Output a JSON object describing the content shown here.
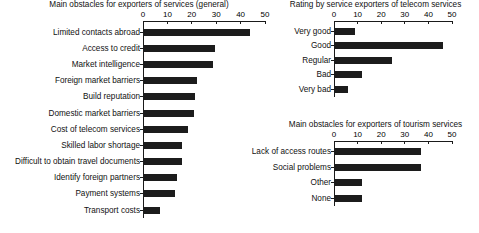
{
  "chart_data": [
    {
      "id": "general",
      "type": "bar",
      "orientation": "horizontal",
      "title": "Main obstacles for exporters of services (general)",
      "xlabel": "",
      "ylabel": "",
      "xlim": [
        0,
        50
      ],
      "ticks": [
        0,
        10,
        20,
        30,
        40,
        50
      ],
      "tick_labels": [
        "0",
        "10",
        "20",
        "30",
        "40",
        "50"
      ],
      "grid": false,
      "legend": "none",
      "categories": [
        "Limited contacts abroad",
        "Access to credit",
        "Market intelligence",
        "Foreign market barriers",
        "Build reputation",
        "Domestic market barriers",
        "Cost of telecom services",
        "Skilled labor shortage",
        "Difficult to obtain travel documents",
        "Identify foreign partners",
        "Payment systems",
        "Transport costs"
      ],
      "values": [
        44,
        29.5,
        28.5,
        22,
        21.5,
        21,
        18.5,
        16,
        16,
        14,
        13,
        7
      ]
    },
    {
      "id": "telecom",
      "type": "bar",
      "orientation": "horizontal",
      "title": "Rating by service exporters of telecom services",
      "xlabel": "",
      "ylabel": "",
      "xlim": [
        0,
        50
      ],
      "ticks": [
        0,
        10,
        20,
        30,
        40,
        50
      ],
      "tick_labels": [
        "0",
        "10",
        "20",
        "30",
        "40",
        "50"
      ],
      "grid": false,
      "legend": "none",
      "categories": [
        "Very good",
        "Good",
        "Regular",
        "Bad",
        "Very bad"
      ],
      "values": [
        9,
        46,
        24.5,
        12,
        6
      ]
    },
    {
      "id": "tourism",
      "type": "bar",
      "orientation": "horizontal",
      "title": "Main obstacles for exporters of tourism services",
      "xlabel": "",
      "ylabel": "",
      "xlim": [
        0,
        50
      ],
      "ticks": [
        0,
        10,
        20,
        30,
        40,
        50
      ],
      "tick_labels": [
        "0",
        "10",
        "20",
        "30",
        "40",
        "50"
      ],
      "grid": false,
      "legend": "none",
      "categories": [
        "Lack of access routes",
        "Social problems",
        "Other",
        "None"
      ],
      "values": [
        37,
        37,
        12,
        12
      ]
    }
  ],
  "style": {
    "bar_color": "#1c1c1c",
    "axis_color": "#1a1a1a",
    "background": "#ffffff",
    "text_color": "#111111"
  }
}
